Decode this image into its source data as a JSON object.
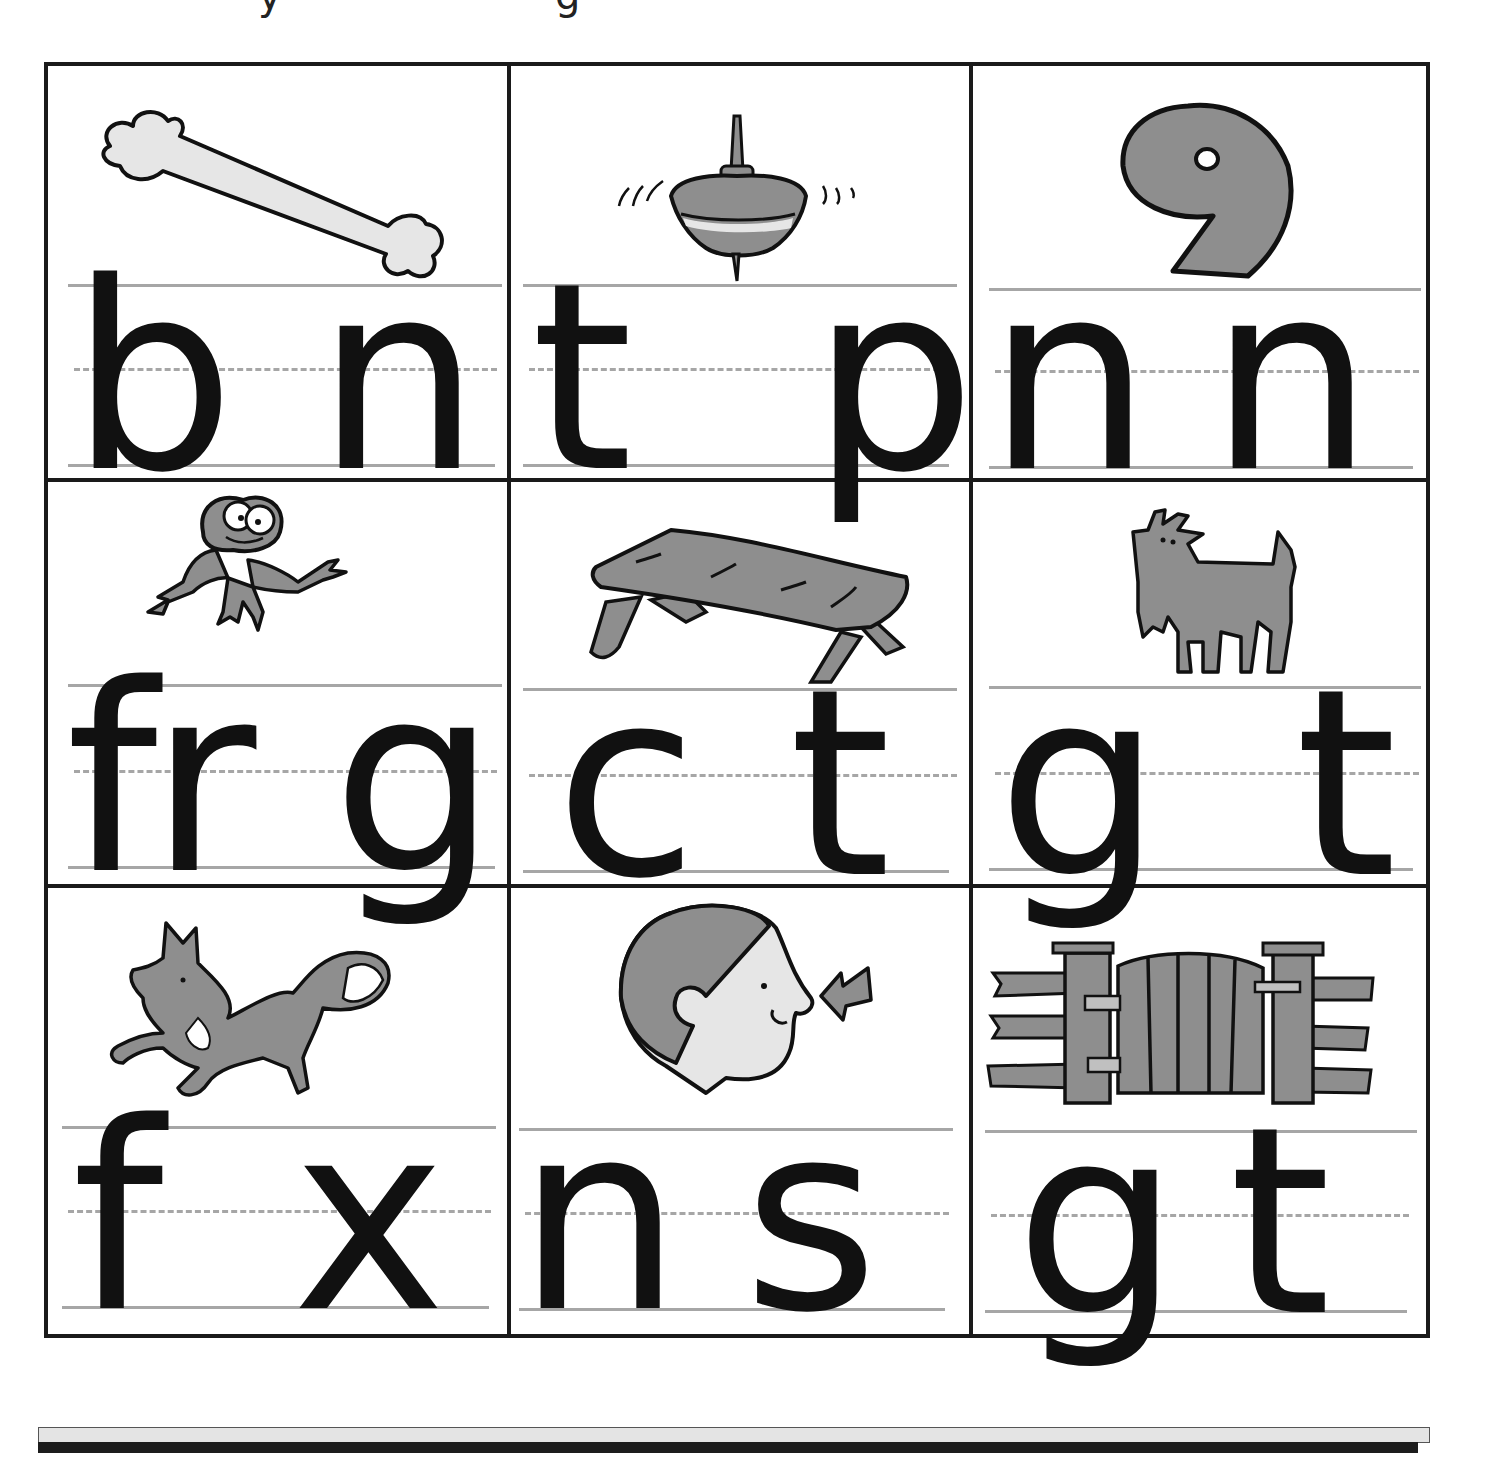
{
  "page": {
    "type": "phonics worksheet",
    "layout": "3x3 picture grid with beginning/ending letter choices",
    "top_cutoff_glyphs": [
      "y",
      "g"
    ]
  },
  "colors": {
    "border": "#1a1a1a",
    "rule_line": "#a6a6a6",
    "illustration_fill": "#8e8e8e",
    "illustration_light_fill": "#e6e6e6",
    "letter": "#111111",
    "bottom_bar": "#e4e4e4"
  },
  "cells": [
    {
      "row": 0,
      "col": 0,
      "picture": "bone",
      "icon": "bone-icon",
      "letters": [
        "b",
        "n"
      ]
    },
    {
      "row": 0,
      "col": 1,
      "picture": "spinning top",
      "icon": "top-icon",
      "letters": [
        "t",
        "p"
      ]
    },
    {
      "row": 0,
      "col": 2,
      "picture": "number nine",
      "icon": "nine-icon",
      "letters": [
        "n",
        "n"
      ]
    },
    {
      "row": 1,
      "col": 0,
      "picture": "frog",
      "icon": "frog-icon",
      "letters": [
        "fr",
        "g"
      ]
    },
    {
      "row": 1,
      "col": 1,
      "picture": "table",
      "icon": "table-icon",
      "letters": [
        "c",
        "t"
      ]
    },
    {
      "row": 1,
      "col": 2,
      "picture": "goat",
      "icon": "goat-icon",
      "letters": [
        "g",
        "t"
      ]
    },
    {
      "row": 2,
      "col": 0,
      "picture": "fox",
      "icon": "fox-icon",
      "letters": [
        "f",
        "x"
      ]
    },
    {
      "row": 2,
      "col": 1,
      "picture": "nose",
      "icon": "nose-icon",
      "letters": [
        "n",
        "s"
      ]
    },
    {
      "row": 2,
      "col": 2,
      "picture": "gate",
      "icon": "gate-icon",
      "letters": [
        "g",
        "t"
      ]
    }
  ]
}
